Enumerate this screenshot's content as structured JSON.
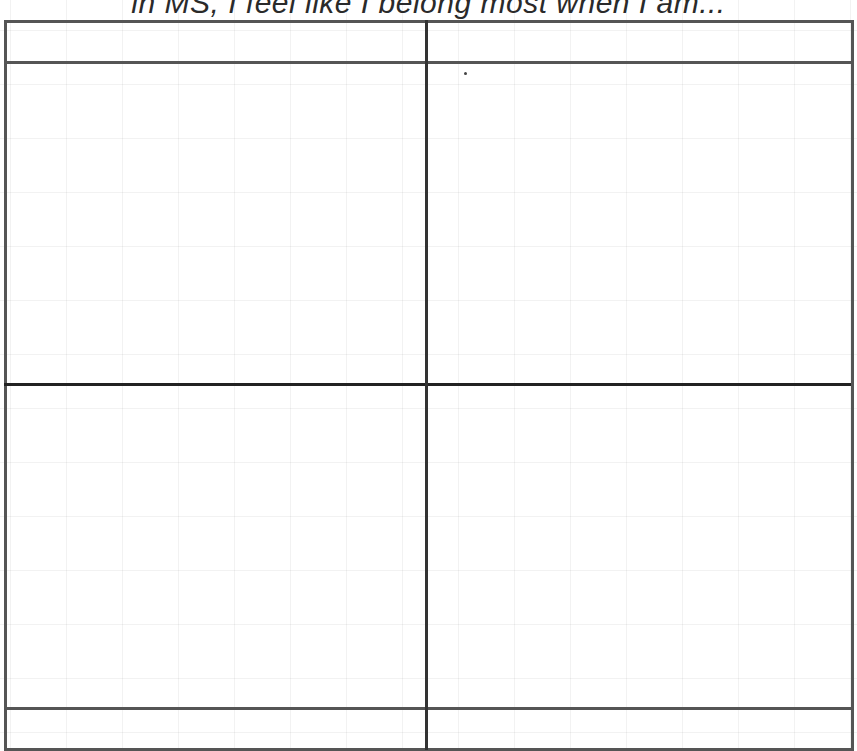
{
  "document": {
    "title": "in MS, I feel like I belong most when I am..."
  },
  "table": {
    "columns": 2,
    "rows": [
      {
        "name": "header-row",
        "cells": [
          "",
          ""
        ]
      },
      {
        "name": "body-row-1",
        "cells": [
          "",
          ""
        ]
      },
      {
        "name": "body-row-2",
        "cells": [
          "",
          ""
        ]
      },
      {
        "name": "footer-row",
        "cells": [
          "",
          ""
        ]
      }
    ]
  },
  "colors": {
    "border": "#555555",
    "divider": "#222222",
    "background": "#ffffff"
  }
}
